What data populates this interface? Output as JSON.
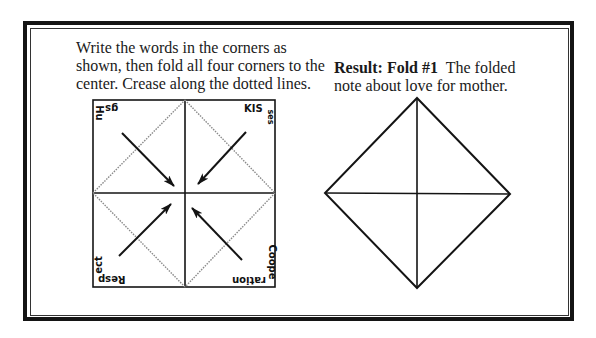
{
  "instructions": {
    "text": "Write the words in the corners as shown, then fold all four corners to the center. Crease along the dotted lines."
  },
  "result": {
    "label": "Result: Fold #1",
    "text": "The folded note about love for mother."
  },
  "diagram_left": {
    "corner_words": {
      "top_left": "Hugs",
      "top_right": "Kisses",
      "bottom_left": "Respect",
      "bottom_right": "Cooperation"
    },
    "corner_fragments": {
      "top_left_a": "Hu",
      "top_left_b": "gs",
      "top_right_a": "KIS",
      "top_right_b": "ses",
      "bottom_left_a": "ect",
      "bottom_left_b": "Resp",
      "bottom_right_a": "Coope",
      "bottom_right_b": "ration"
    },
    "arrows": [
      "top-left-to-center",
      "top-right-to-center",
      "bottom-left-to-center",
      "bottom-right-to-center"
    ],
    "fold_lines": "dotted"
  },
  "diagram_right": {
    "shape": "diamond-with-cross"
  },
  "colors": {
    "ink": "#141414",
    "dotted": "#8a8a8a",
    "background": "#ffffff"
  }
}
